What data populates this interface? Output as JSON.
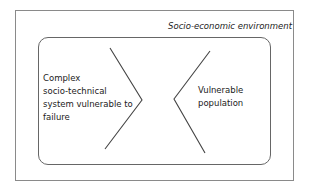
{
  "diagram": {
    "outer_box": {
      "label": "Socio-economic environment"
    },
    "inner_box": {
      "left_node": {
        "label": "Complex\nsocio-technical\nsystem vulnerable to\nfailure"
      },
      "right_node": {
        "label": "Vulnerable\npopulation"
      }
    },
    "connectors": [
      {
        "name": "left-chevron",
        "points": [
          [
            110,
            48
          ],
          [
            142,
            100
          ],
          [
            105,
            149
          ]
        ]
      },
      {
        "name": "right-chevron",
        "points": [
          [
            210,
            51
          ],
          [
            174,
            99
          ],
          [
            205,
            153
          ]
        ]
      }
    ],
    "colors": {
      "line": "#444444",
      "border": "#8a8a8a"
    }
  }
}
